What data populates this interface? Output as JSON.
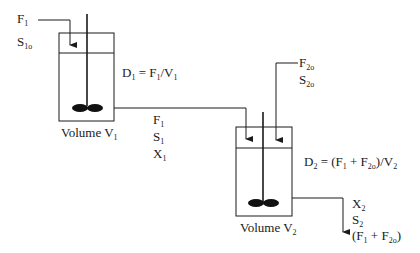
{
  "diagram": {
    "type": "two-stage chemostat (CSTRs in series)",
    "tank1": {
      "inlet": {
        "flow": "F",
        "flow_sub": "1",
        "substrate": "S",
        "substrate_sub": "1o"
      },
      "dilution": {
        "lhs": "D",
        "lhs_sub": "1",
        "eq": " = F",
        "eq_sub": "1",
        "div": "/V",
        "div_sub": "1"
      },
      "volume_label": "Volume V",
      "volume_sub": "1",
      "outlet": {
        "flow": "F",
        "flow_sub": "1",
        "substrate": "S",
        "substrate_sub": "1",
        "biomass": "X",
        "biomass_sub": "1"
      }
    },
    "tank2": {
      "inlet": {
        "flow": "F",
        "flow_sub": "2o",
        "substrate": "S",
        "substrate_sub": "2o"
      },
      "dilution": {
        "lhs": "D",
        "lhs_sub": "2",
        "p1": " = (F",
        "p1_sub": "1",
        "p2": " + F",
        "p2_sub": "2o",
        "p3": ")/V",
        "p3_sub": "2"
      },
      "volume_label": "Volume V",
      "volume_sub": "2",
      "outlet": {
        "biomass": "X",
        "biomass_sub": "2",
        "substrate": "S",
        "substrate_sub": "2",
        "flow_a": "(F",
        "flow_a_sub": "1",
        "flow_b": " + F",
        "flow_b_sub": "2o",
        "flow_c": ")"
      }
    }
  }
}
